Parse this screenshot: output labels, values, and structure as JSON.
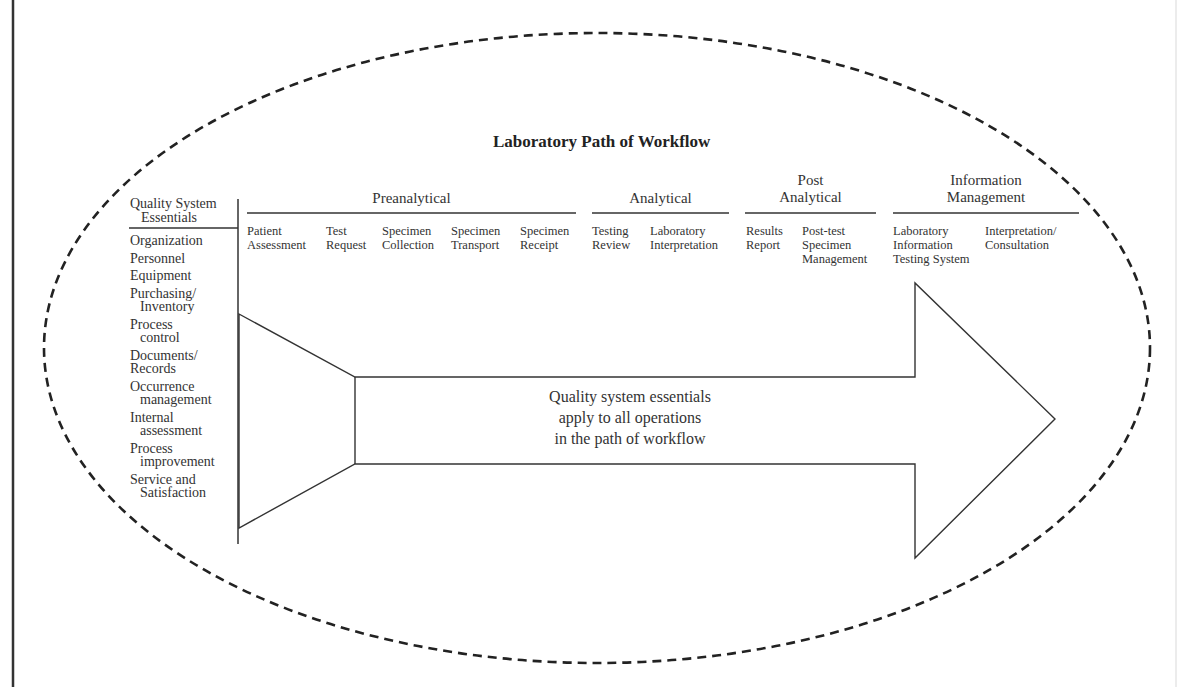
{
  "diagram": {
    "title": "Laboratory Path of Workflow",
    "left_column": {
      "header": [
        "Quality System",
        "Essentials"
      ],
      "items": [
        {
          "line1": "Organization",
          "line2": ""
        },
        {
          "line1": "Personnel",
          "line2": ""
        },
        {
          "line1": "Equipment",
          "line2": ""
        },
        {
          "line1": "Purchasing/",
          "line2": "Inventory"
        },
        {
          "line1": "Process",
          "line2": "control"
        },
        {
          "line1": "Documents/",
          "line2": "Records"
        },
        {
          "line1": "Occurrence",
          "line2": "management"
        },
        {
          "line1": "Internal",
          "line2": "assessment"
        },
        {
          "line1": "Process",
          "line2": "improvement"
        },
        {
          "line1": "Service and",
          "line2": "Satisfaction"
        }
      ]
    },
    "phases": [
      {
        "name": "Preanalytical",
        "name_lines": [
          "Preanalytical"
        ],
        "steps": [
          {
            "lines": [
              "Patient",
              "Assessment"
            ]
          },
          {
            "lines": [
              "Test",
              "Request"
            ]
          },
          {
            "lines": [
              "Specimen",
              "Collection"
            ]
          },
          {
            "lines": [
              "Specimen",
              "Transport"
            ]
          },
          {
            "lines": [
              "Specimen",
              "Receipt"
            ]
          }
        ]
      },
      {
        "name": "Analytical",
        "name_lines": [
          "Analytical"
        ],
        "steps": [
          {
            "lines": [
              "Testing",
              "Review"
            ]
          },
          {
            "lines": [
              "Laboratory",
              "Interpretation"
            ]
          }
        ]
      },
      {
        "name": "Post Analytical",
        "name_lines": [
          "Post",
          "Analytical"
        ],
        "steps": [
          {
            "lines": [
              "Results",
              "Report"
            ]
          },
          {
            "lines": [
              "Post-test",
              "Specimen",
              "Management"
            ]
          }
        ]
      },
      {
        "name": "Information Management",
        "name_lines": [
          "Information",
          "Management"
        ],
        "steps": [
          {
            "lines": [
              "Laboratory",
              "Information",
              "Testing System"
            ]
          },
          {
            "lines": [
              "Interpretation/",
              "Consultation"
            ]
          }
        ]
      }
    ],
    "arrow_text": [
      "Quality system essentials",
      "apply to all operations",
      "in the path of workflow"
    ],
    "colors": {
      "line": "#333333",
      "dash": "#222222",
      "text": "#333333",
      "background": "#ffffff"
    }
  }
}
